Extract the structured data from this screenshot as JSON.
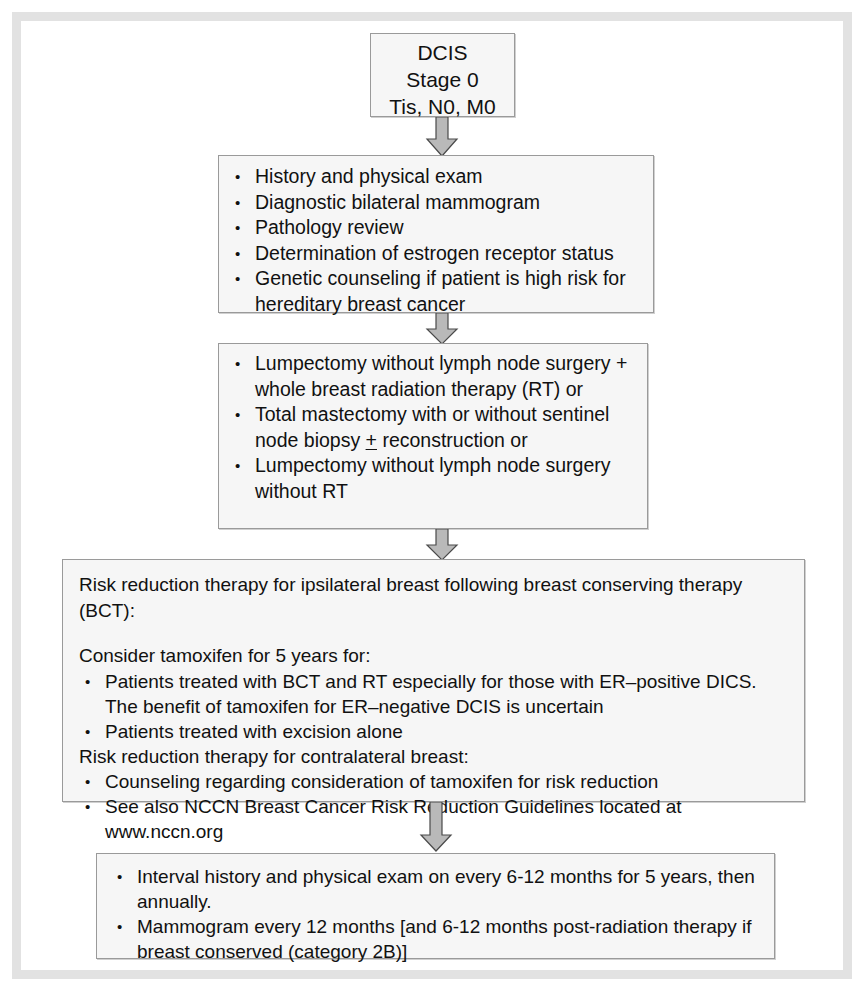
{
  "document": {
    "title": "DCIS Stage 0 Treatment Flowchart",
    "frame_color": "#e2e2e2",
    "box_fill": "#f6f6f6",
    "box_border": "#9a9a9a",
    "arrow_fill": "#b8b8b8",
    "arrow_stroke": "#555555"
  },
  "nodes": {
    "diagnosis": {
      "name": "diagnosis-box",
      "lines": [
        "DCIS",
        "Stage 0",
        "Tis, N0, M0"
      ]
    },
    "workup": {
      "name": "workup-box",
      "bullets": [
        "History and physical exam",
        "Diagnostic bilateral mammogram",
        "Pathology review",
        "Determination of estrogen receptor status",
        "Genetic counseling if patient is high risk for hereditary breast cancer"
      ]
    },
    "treatment": {
      "name": "primary-treatment-box",
      "bullets": [
        {
          "pre": "Lumpectomy without lymph node surgery + whole breast radiation therapy (RT) or",
          "pm": "",
          "post": ""
        },
        {
          "pre": "Total mastectomy with or without sentinel node biopsy ",
          "pm": "+",
          "post": " reconstruction or"
        },
        {
          "pre": "Lumpectomy without lymph node surgery without RT",
          "pm": "",
          "post": ""
        }
      ]
    },
    "risk_reduction": {
      "name": "risk-reduction-box",
      "heading": "Risk reduction therapy for ipsilateral breast following breast conserving therapy (BCT):",
      "subheading": "Consider tamoxifen for 5 years for:",
      "bullets_ipsilateral": [
        "Patients treated with BCT and RT especially for those with ER–positive DICS. The benefit of tamoxifen for ER–negative DCIS is uncertain",
        "Patients treated with excision alone"
      ],
      "contralateral_heading": "Risk reduction therapy for contralateral breast:",
      "bullets_contralateral": [
        "Counseling regarding consideration of tamoxifen for risk reduction",
        "See also NCCN Breast Cancer Risk Reduction Guidelines located at www.nccn.org"
      ]
    },
    "surveillance": {
      "name": "surveillance-box",
      "bullets": [
        "Interval history and physical exam on every 6-12 months for 5 years, then annually.",
        "Mammogram every 12 months [and 6-12 months post-radiation therapy if breast conserved (category 2B)]"
      ]
    }
  },
  "connectors": [
    {
      "name": "arrow-diagnosis-to-workup",
      "label": "down-arrow"
    },
    {
      "name": "arrow-workup-to-treatment",
      "label": "down-arrow"
    },
    {
      "name": "arrow-treatment-to-risk-reduction",
      "label": "down-arrow"
    },
    {
      "name": "arrow-risk-reduction-to-surveillance",
      "label": "down-arrow"
    }
  ]
}
